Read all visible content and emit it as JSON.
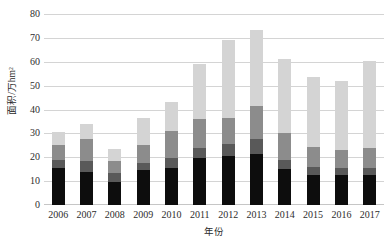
{
  "chart_data": {
    "type": "bar",
    "stacked": true,
    "title": "",
    "xlabel": "年份",
    "ylabel": "面积/万hm²",
    "ylim": [
      0,
      80
    ],
    "ytick_step": 10,
    "yticks": [
      "0",
      "10",
      "20",
      "30",
      "40",
      "50",
      "60",
      "70",
      "80"
    ],
    "grid": true,
    "legend": "none",
    "categories": [
      "2006",
      "2007",
      "2008",
      "2009",
      "2010",
      "2011",
      "2012",
      "2013",
      "2014",
      "2015",
      "2016",
      "2017"
    ],
    "series": [
      {
        "name": "series-1",
        "color": "#0d0d0d",
        "values": [
          15.5,
          14.0,
          9.5,
          14.5,
          15.5,
          19.5,
          20.5,
          21.5,
          15.0,
          12.5,
          12.5,
          12.5
        ]
      },
      {
        "name": "series-2",
        "color": "#595959",
        "values": [
          3.5,
          4.5,
          4.0,
          3.0,
          4.0,
          4.5,
          5.0,
          6.0,
          4.0,
          3.5,
          3.0,
          3.0
        ]
      },
      {
        "name": "series-3",
        "color": "#8c8c8c",
        "values": [
          6.0,
          9.0,
          5.0,
          7.5,
          11.5,
          12.0,
          11.0,
          14.0,
          11.0,
          8.5,
          7.5,
          8.5
        ]
      },
      {
        "name": "series-4",
        "color": "#d4d4d4",
        "values": [
          5.5,
          6.5,
          5.0,
          11.5,
          12.0,
          23.0,
          32.5,
          32.0,
          31.0,
          29.0,
          29.0,
          36.5
        ]
      }
    ],
    "totals": [
      30.5,
      34.0,
      23.5,
      36.5,
      43.0,
      59.0,
      69.0,
      73.5,
      61.0,
      53.5,
      52.0,
      60.5
    ]
  },
  "colors": {
    "gridline": "#d4d4d4",
    "axis_text": "#2d2d2d",
    "background": "#ffffff"
  }
}
